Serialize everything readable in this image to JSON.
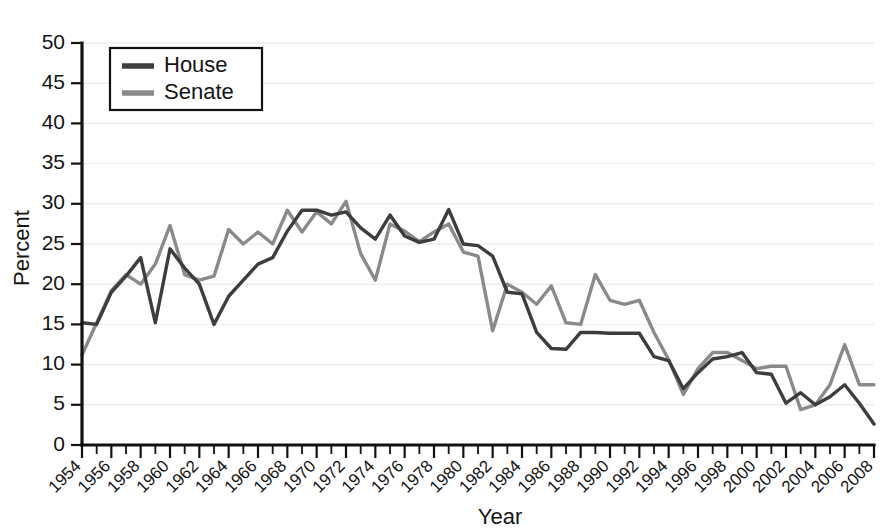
{
  "chart_data": {
    "type": "line",
    "title": "",
    "subtitle": "",
    "xlabel": "Year",
    "ylabel": "Percent",
    "xlim": [
      1954,
      2008
    ],
    "ylim": [
      0,
      50
    ],
    "ytick_step": 5,
    "xtick_step": 2,
    "minor_xtick_step": 1,
    "grid": "horizontal",
    "legend_position": "top-left",
    "yticks": [
      0,
      5,
      10,
      15,
      20,
      25,
      30,
      35,
      40,
      45,
      50
    ],
    "ytick_labels": [
      "0",
      "5",
      "10",
      "15",
      "20",
      "25",
      "30",
      "35",
      "40",
      "45",
      "50"
    ],
    "xticks": [
      1954,
      1956,
      1958,
      1960,
      1962,
      1964,
      1966,
      1968,
      1970,
      1972,
      1974,
      1976,
      1978,
      1980,
      1982,
      1984,
      1986,
      1988,
      1990,
      1992,
      1994,
      1996,
      1998,
      2000,
      2002,
      2004,
      2006,
      2008
    ],
    "xtick_labels": [
      "1954",
      "1956",
      "1958",
      "1960",
      "1962",
      "1964",
      "1966",
      "1968",
      "1970",
      "1972",
      "1974",
      "1976",
      "1978",
      "1980",
      "1982",
      "1984",
      "1986",
      "1988",
      "1990",
      "1992",
      "1994",
      "1996",
      "1998",
      "2000",
      "2002",
      "2004",
      "2006",
      "2008"
    ],
    "x": [
      1954,
      1955,
      1956,
      1957,
      1958,
      1959,
      1960,
      1961,
      1962,
      1963,
      1964,
      1965,
      1966,
      1967,
      1968,
      1969,
      1970,
      1971,
      1972,
      1973,
      1974,
      1975,
      1976,
      1977,
      1978,
      1979,
      1980,
      1981,
      1982,
      1983,
      1984,
      1985,
      1986,
      1987,
      1988,
      1989,
      1990,
      1991,
      1992,
      1993,
      1994,
      1995,
      1996,
      1997,
      1998,
      1999,
      2000,
      2001,
      2002,
      2003,
      2004,
      2005,
      2006,
      2007,
      2008
    ],
    "series": [
      {
        "name": "House",
        "color": "#3d3d3d",
        "values": [
          15.2,
          15.0,
          19.0,
          21.0,
          23.3,
          15.2,
          24.4,
          22.0,
          20.0,
          15.0,
          18.5,
          20.5,
          22.5,
          23.3,
          26.6,
          29.2,
          29.2,
          28.6,
          29.0,
          27.0,
          25.6,
          28.6,
          26.0,
          25.2,
          25.6,
          29.3,
          25.0,
          24.8,
          23.5,
          19.0,
          18.8,
          14.0,
          12.0,
          11.9,
          14.0,
          14.0,
          13.9,
          13.9,
          13.9,
          11.0,
          10.5,
          7.0,
          9.0,
          10.7,
          11.0,
          11.5,
          9.0,
          8.8,
          5.2,
          6.5,
          5.0,
          6.0,
          7.5,
          5.2,
          2.6
        ]
      },
      {
        "name": "Senate",
        "color": "#8a8a8a",
        "values": [
          11.2,
          15.2,
          19.2,
          21.2,
          20.0,
          22.5,
          27.3,
          21.2,
          20.5,
          21.0,
          26.8,
          25.0,
          26.5,
          25.0,
          29.2,
          26.5,
          29.0,
          27.5,
          30.3,
          23.8,
          20.5,
          27.5,
          26.6,
          25.3,
          26.5,
          27.5,
          24.0,
          23.5,
          14.2,
          20.0,
          19.0,
          17.5,
          19.8,
          15.2,
          15.0,
          21.2,
          18.0,
          17.5,
          18.0,
          14.0,
          10.6,
          6.3,
          9.5,
          11.5,
          11.5,
          10.5,
          9.5,
          9.8,
          9.8,
          4.4,
          5.0,
          7.5,
          12.5,
          7.5,
          7.5
        ]
      }
    ]
  },
  "legend": {
    "entries": [
      {
        "label": "House",
        "color": "#3d3d3d"
      },
      {
        "label": "Senate",
        "color": "#8a8a8a"
      }
    ]
  },
  "axes": {
    "y_title": "Percent",
    "x_title": "Year"
  }
}
